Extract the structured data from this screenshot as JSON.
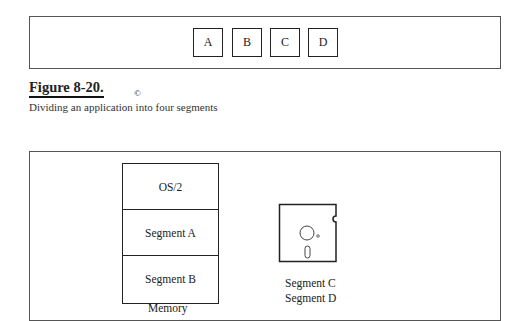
{
  "top_panel": {
    "segments": [
      "A",
      "B",
      "C",
      "D"
    ]
  },
  "figure": {
    "title": "Figure 8-20.",
    "caption": "Dividing an application into four segments",
    "copyright_mark": "©"
  },
  "bottom_panel": {
    "memory": {
      "cells": [
        "OS/2",
        "Segment A",
        "Segment B"
      ],
      "label": "Memory"
    },
    "disk": {
      "icon": "floppy-disk-icon",
      "labels": [
        "Segment C",
        "Segment D"
      ]
    }
  }
}
